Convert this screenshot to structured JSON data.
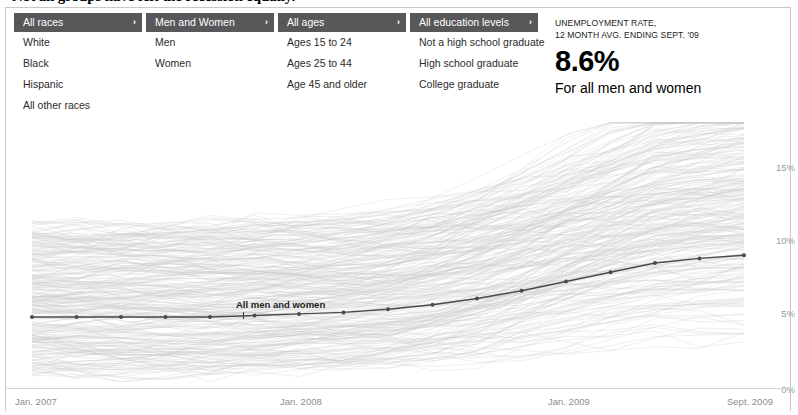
{
  "headline": "Not all groups have felt the recession equally.",
  "selectors": [
    {
      "name": "race",
      "selected": "All races",
      "chevron": "›",
      "options": [
        "White",
        "Black",
        "Hispanic",
        "All other races"
      ]
    },
    {
      "name": "gender",
      "selected": "Men and Women",
      "chevron": "›",
      "options": [
        "Men",
        "Women"
      ]
    },
    {
      "name": "age",
      "selected": "All ages",
      "chevron": "›",
      "options": [
        "Ages 15 to 24",
        "Ages 25 to 44",
        "Age 45 and older"
      ]
    },
    {
      "name": "education",
      "selected": "All education levels",
      "chevron": "›",
      "options": [
        "Not a high school graduate",
        "High school graduate",
        "College graduate"
      ]
    }
  ],
  "readout": {
    "kicker_line1": "UNEMPLOYMENT RATE,",
    "kicker_line2": "12 MONTH AVG. ENDING SEPT. '09",
    "value": "8.6%",
    "subtitle": "For all men and women"
  },
  "chart_data": {
    "type": "line",
    "title": "",
    "xlabel": "",
    "ylabel": "",
    "series_label": "All men and women",
    "grid": false,
    "legend_position": "inline-annotation",
    "ylim": [
      0,
      17.5
    ],
    "ytick_labels": [
      "15%",
      "10%",
      "5%",
      "0%"
    ],
    "ytick_values": [
      15,
      10,
      5,
      0
    ],
    "xtick_labels": [
      "Jan. 2007",
      "Jan. 2008",
      "Jan. 2009",
      "Sept. 2009"
    ],
    "xtick_values": [
      "2007-01",
      "2008-01",
      "2009-01",
      "2009-09"
    ],
    "x": [
      "2007-01",
      "2007-03",
      "2007-05",
      "2007-07",
      "2007-09",
      "2007-11",
      "2008-01",
      "2008-03",
      "2008-05",
      "2008-07",
      "2008-09",
      "2008-11",
      "2009-01",
      "2009-03",
      "2009-05",
      "2009-07",
      "2009-09"
    ],
    "series": [
      {
        "name": "All men and women",
        "color": "#4a4a4a",
        "highlighted": true,
        "values": [
          4.6,
          4.6,
          4.6,
          4.6,
          4.6,
          4.7,
          4.8,
          4.9,
          5.1,
          5.4,
          5.8,
          6.3,
          6.9,
          7.5,
          8.1,
          8.4,
          8.6
        ]
      }
    ],
    "background_series_note": "~250 faint gray lines for every race / gender / age / education subgroup, spanning roughly 2% to 17%",
    "background_color": "#c9c9c9"
  }
}
